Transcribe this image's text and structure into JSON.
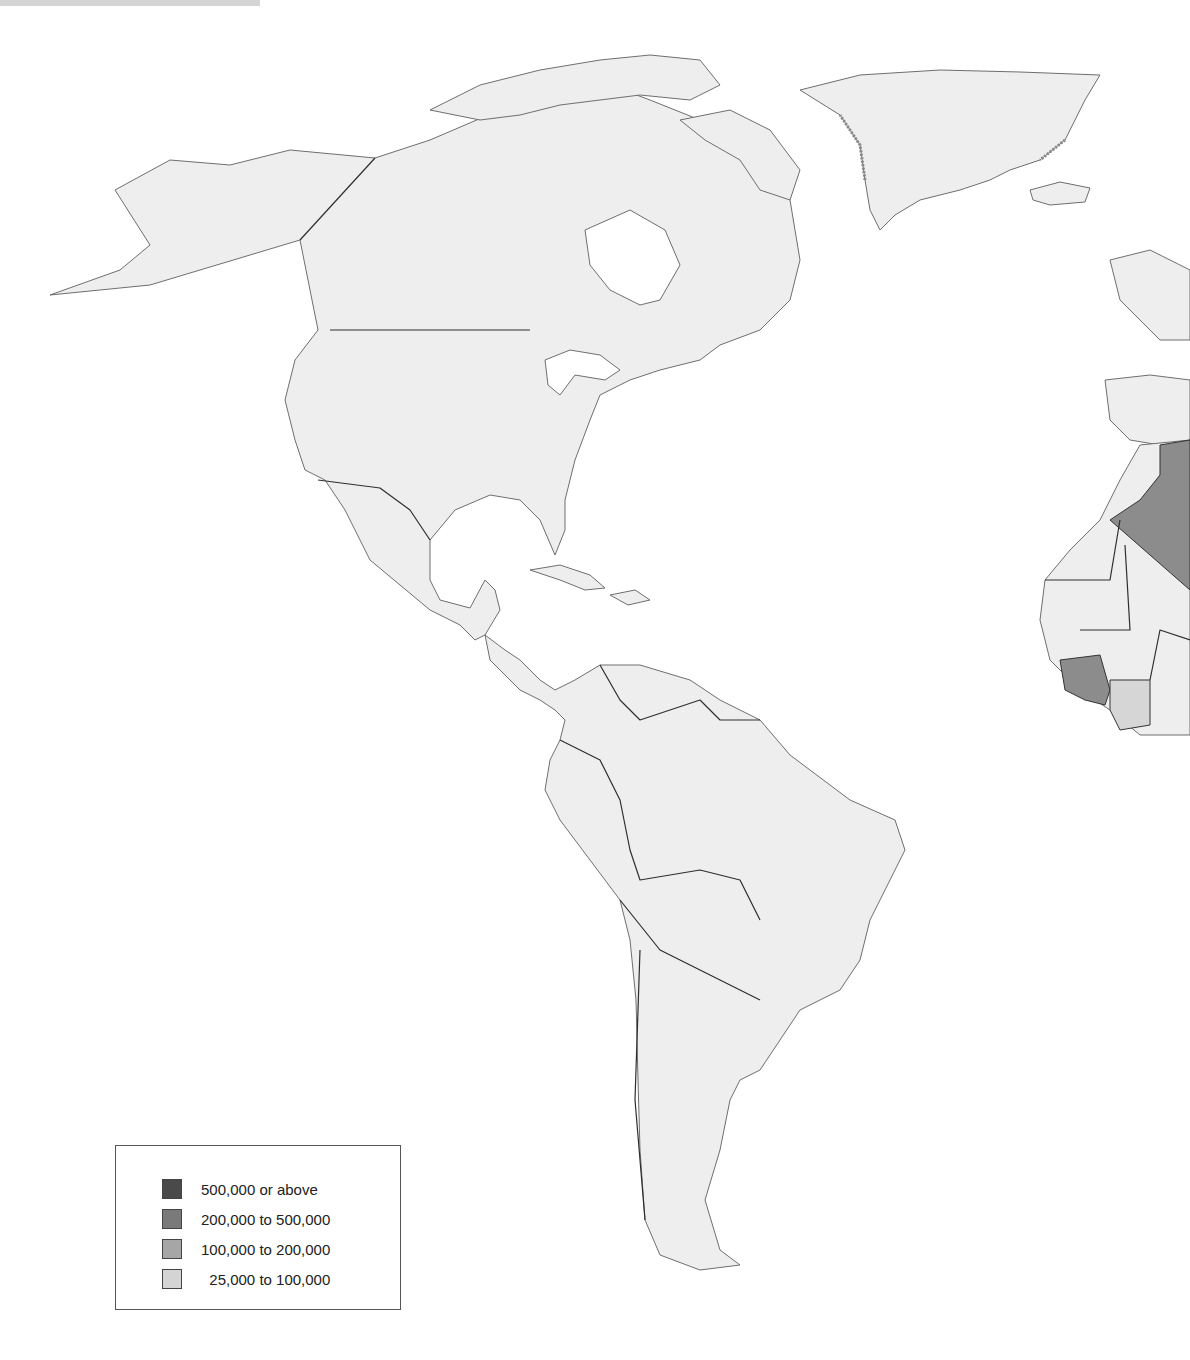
{
  "map": {
    "region": "Americas and West Africa / Western Europe",
    "land_color": "#eeeeee",
    "water_color": "#ffffff",
    "border_color": "#2e2e2e",
    "shaded_regions": [
      {
        "name": "Algeria",
        "class": "200,000 to 500,000",
        "color": "#8c8c8c"
      },
      {
        "name": "Guinea",
        "class": "200,000 to 500,000",
        "color": "#8c8c8c"
      },
      {
        "name": "Côte d'Ivoire",
        "class": "25,000 to 100,000",
        "color": "#d6d6d6"
      }
    ]
  },
  "legend": {
    "items": [
      {
        "label": "500,000 or above",
        "color": "#4a4a4a"
      },
      {
        "label": "200,000 to 500,000",
        "color": "#7a7a7a"
      },
      {
        "label": "100,000 to 200,000",
        "color": "#a6a6a6"
      },
      {
        "label": "  25,000 to 100,000",
        "color": "#d4d4d4"
      }
    ]
  }
}
